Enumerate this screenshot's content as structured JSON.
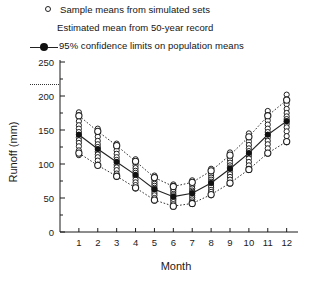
{
  "chart_data": {
    "type": "scatter",
    "title": "",
    "xlabel": "Month",
    "ylabel": "Runoff (mm)",
    "xlim": [
      0,
      12.6
    ],
    "ylim": [
      0,
      250
    ],
    "ytick_step": 50,
    "yminor_step": 25,
    "grid": false,
    "legend_position": "above-plot",
    "x": [
      1,
      2,
      3,
      4,
      5,
      6,
      7,
      8,
      9,
      10,
      11,
      12
    ],
    "categories": [
      "1",
      "2",
      "3",
      "4",
      "5",
      "6",
      "7",
      "8",
      "9",
      "10",
      "11",
      "12"
    ],
    "xticklabels": [
      "1",
      "2",
      "3",
      "4",
      "5",
      "6",
      "7",
      "8",
      "9",
      "10",
      "11",
      "12"
    ],
    "yticklabels": [
      "0",
      "50",
      "100",
      "150",
      "200",
      "250"
    ],
    "yticks": [
      0,
      50,
      100,
      150,
      200,
      250
    ],
    "series": [
      {
        "name": "Estimated mean from 50-year record",
        "marker": "filled-circle",
        "line": "solid",
        "values": [
          143,
          122,
          103,
          84,
          63,
          52,
          57,
          72,
          93,
          116,
          143,
          163
        ]
      },
      {
        "name": "95% confidence limits on population means (upper)",
        "marker": "open-circle",
        "line": "dotted",
        "values": [
          171,
          148,
          127,
          104,
          80,
          67,
          73,
          90,
          113,
          140,
          171,
          194
        ]
      },
      {
        "name": "95% confidence limits on population means (lower)",
        "marker": "open-circle",
        "line": "dotted",
        "values": [
          116,
          98,
          82,
          65,
          47,
          38,
          42,
          55,
          72,
          92,
          116,
          133
        ]
      }
    ],
    "scatter_clouds": [
      {
        "month": 1,
        "values": [
          176,
          170,
          163,
          157,
          152,
          147,
          143,
          139,
          135,
          131,
          126,
          120,
          113
        ]
      },
      {
        "month": 2,
        "values": [
          152,
          146,
          140,
          134,
          129,
          125,
          122,
          118,
          114,
          110,
          105,
          99
        ]
      },
      {
        "month": 3,
        "values": [
          130,
          125,
          120,
          115,
          110,
          106,
          103,
          99,
          95,
          91,
          86,
          81
        ]
      },
      {
        "month": 4,
        "values": [
          107,
          102,
          98,
          94,
          90,
          87,
          84,
          81,
          77,
          73,
          69,
          64
        ]
      },
      {
        "month": 5,
        "values": [
          83,
          78,
          74,
          71,
          68,
          65,
          63,
          60,
          57,
          54,
          50,
          46
        ]
      },
      {
        "month": 6,
        "values": [
          70,
          66,
          62,
          59,
          56,
          54,
          52,
          49,
          47,
          44,
          41,
          37
        ]
      },
      {
        "month": 7,
        "values": [
          76,
          72,
          68,
          64,
          61,
          59,
          57,
          54,
          51,
          48,
          45,
          41
        ]
      },
      {
        "month": 8,
        "values": [
          93,
          88,
          84,
          80,
          77,
          74,
          72,
          69,
          66,
          62,
          59,
          54
        ]
      },
      {
        "month": 9,
        "values": [
          117,
          111,
          106,
          102,
          98,
          95,
          93,
          89,
          85,
          81,
          77,
          71
        ]
      },
      {
        "month": 10,
        "values": [
          145,
          139,
          133,
          128,
          123,
          119,
          116,
          112,
          108,
          103,
          98,
          91
        ]
      },
      {
        "month": 11,
        "values": [
          178,
          171,
          164,
          158,
          152,
          147,
          143,
          139,
          134,
          129,
          123,
          115
        ]
      },
      {
        "month": 12,
        "values": [
          202,
          195,
          188,
          181,
          175,
          170,
          166,
          163,
          159,
          154,
          148,
          141,
          132
        ]
      }
    ]
  },
  "legend": {
    "items": [
      {
        "key": "open-circle",
        "label": "Sample means from simulated sets"
      },
      {
        "key": "filled-circle-line",
        "label": "Estimated mean from 50-year record"
      },
      {
        "key": "dotted-line",
        "label": "95% confidence limits on population means"
      }
    ]
  },
  "colors": {
    "axis": "#1a1a1a",
    "marker_fill": "#111111",
    "marker_open_stroke": "#222222",
    "line": "#222222",
    "dotted": "#333333",
    "background": "#ffffff"
  }
}
